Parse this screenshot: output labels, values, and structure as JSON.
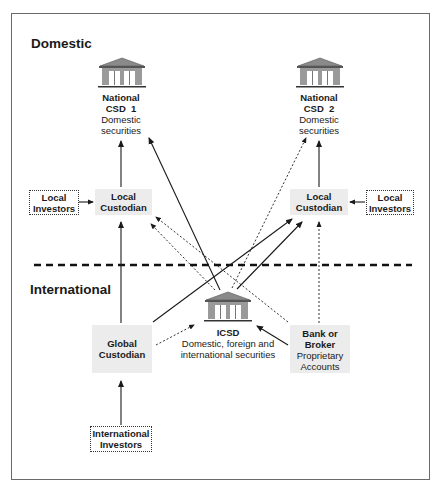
{
  "sections": {
    "domestic": "Domestic",
    "international": "International"
  },
  "nodes": {
    "csd1": {
      "title_line1": "National",
      "title_line2": "CSD  1",
      "sub_line1": "Domestic",
      "sub_line2": "securities",
      "icon": "bank-building-icon"
    },
    "csd2": {
      "title_line1": "National",
      "title_line2": "CSD  2",
      "sub_line1": "Domestic",
      "sub_line2": "securities",
      "icon": "bank-building-icon"
    },
    "local_investors_left": {
      "line1": "Local",
      "line2": "Investors"
    },
    "local_custodian_left": {
      "line1": "Local",
      "line2": "Custodian"
    },
    "local_custodian_right": {
      "line1": "Local",
      "line2": "Custodian"
    },
    "local_investors_right": {
      "line1": "Local",
      "line2": "Investors"
    },
    "icsd": {
      "title": "ICSD",
      "sub_line1": "Domestic, foreign and",
      "sub_line2": "international securities",
      "icon": "bank-building-icon"
    },
    "global_custodian": {
      "line1": "Global",
      "line2": "Custodian"
    },
    "bank_broker": {
      "title_line1": "Bank or",
      "title_line2": "Broker",
      "sub_line1": "Proprietary",
      "sub_line2": "Accounts"
    },
    "international_investors": {
      "line1": "International",
      "line2": "Investors"
    }
  },
  "edges": [
    {
      "from": "Local Investors (left)",
      "to": "Local Custodian (left)",
      "style": "solid"
    },
    {
      "from": "Local Custodian (left)",
      "to": "National CSD 1",
      "style": "solid"
    },
    {
      "from": "Global Custodian",
      "to": "Local Custodian (left)",
      "style": "solid"
    },
    {
      "from": "ICSD",
      "to": "National CSD 1",
      "style": "solid"
    },
    {
      "from": "ICSD",
      "to": "National CSD 2",
      "style": "dotted"
    },
    {
      "from": "ICSD",
      "to": "Local Custodian (left)",
      "style": "dotted"
    },
    {
      "from": "Bank or Broker",
      "to": "Local Custodian (left)",
      "style": "dotted"
    },
    {
      "from": "Global Custodian",
      "to": "Local Custodian (right)",
      "style": "solid"
    },
    {
      "from": "ICSD",
      "to": "Local Custodian (right)",
      "style": "solid"
    },
    {
      "from": "Local Custodian (right)",
      "to": "National CSD 2",
      "style": "solid"
    },
    {
      "from": "Local Investors (right)",
      "to": "Local Custodian (right)",
      "style": "solid"
    },
    {
      "from": "Bank or Broker",
      "to": "Local Custodian (right)",
      "style": "dotted"
    },
    {
      "from": "Global Custodian",
      "to": "ICSD",
      "style": "dotted"
    },
    {
      "from": "Bank or Broker",
      "to": "ICSD",
      "style": "solid"
    },
    {
      "from": "International Investors",
      "to": "Global Custodian",
      "style": "solid"
    }
  ],
  "colors": {
    "line": "#1a1a1a",
    "shaded_box": "#ececec",
    "frame": "#6a6a6a",
    "building": "#8a8a8a"
  }
}
